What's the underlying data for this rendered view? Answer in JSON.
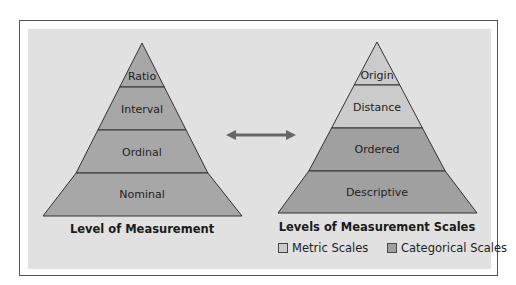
{
  "colors": {
    "panel_bg": "#e1e1e1",
    "left_pyramid": "#a7a7a7",
    "metric": "#cbcbcb",
    "categorical": "#a0a0a0",
    "outline": "#333333"
  },
  "left_pyramid": {
    "title": "Level of Measurement",
    "levels": [
      {
        "label": "Ratio"
      },
      {
        "label": "Interval"
      },
      {
        "label": "Ordinal"
      },
      {
        "label": "Nominal"
      }
    ]
  },
  "right_pyramid": {
    "title": "Levels of Measurement Scales",
    "levels": [
      {
        "label": "Origin",
        "group": "metric"
      },
      {
        "label": "Distance",
        "group": "metric"
      },
      {
        "label": "Ordered",
        "group": "categorical"
      },
      {
        "label": "Descriptive",
        "group": "categorical"
      }
    ]
  },
  "connector": {
    "icon": "double-arrow-icon"
  },
  "legend": {
    "items": [
      {
        "label": "Metric Scales",
        "color": "#cbcbcb"
      },
      {
        "label": "Categorical Scales",
        "color": "#a0a0a0"
      }
    ]
  }
}
